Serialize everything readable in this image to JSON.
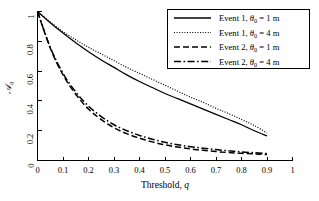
{
  "chart_data": {
    "type": "line",
    "title": "",
    "xlabel": "Threshold, q",
    "ylabel": "A_q",
    "ylabel_symbol": "A",
    "ylabel_subscript": "q",
    "xlim": [
      0,
      1
    ],
    "ylim": [
      0,
      1
    ],
    "grid": false,
    "legend_position": "top-right",
    "xticks": [
      "0",
      "0.1",
      "0.2",
      "0.3",
      "0.4",
      "0.5",
      "0.6",
      "0.7",
      "0.8",
      "0.9",
      "1"
    ],
    "xtick_values": [
      0,
      0.1,
      0.2,
      0.3,
      0.4,
      0.5,
      0.6,
      0.7,
      0.8,
      0.9,
      1
    ],
    "yticks": [
      "0",
      "0.2",
      "0.4",
      "0.6",
      "0.8",
      "1"
    ],
    "ytick_values": [
      0,
      0.2,
      0.4,
      0.6,
      0.8,
      1
    ],
    "x": [
      0,
      0.05,
      0.1,
      0.15,
      0.2,
      0.25,
      0.3,
      0.35,
      0.4,
      0.45,
      0.5,
      0.55,
      0.6,
      0.65,
      0.7,
      0.75,
      0.8,
      0.85,
      0.9
    ],
    "series": [
      {
        "name": "Event 1, θ₀ = 1 m",
        "event": "Event 1",
        "theta_0": "1 m",
        "style": "solid",
        "values": [
          1.0,
          0.925,
          0.855,
          0.79,
          0.73,
          0.675,
          0.625,
          0.575,
          0.53,
          0.49,
          0.45,
          0.415,
          0.38,
          0.345,
          0.31,
          0.275,
          0.24,
          0.2,
          0.165
        ]
      },
      {
        "name": "Event 1, θ₀ = 4 m",
        "event": "Event 1",
        "theta_0": "4 m",
        "style": "dotted",
        "values": [
          1.0,
          0.93,
          0.865,
          0.81,
          0.76,
          0.715,
          0.67,
          0.625,
          0.585,
          0.545,
          0.505,
          0.465,
          0.425,
          0.39,
          0.35,
          0.315,
          0.275,
          0.235,
          0.185
        ]
      },
      {
        "name": "Event 2, θ₀ = 1 m",
        "event": "Event 2",
        "theta_0": "1 m",
        "style": "dashed",
        "values": [
          1.0,
          0.755,
          0.575,
          0.445,
          0.345,
          0.275,
          0.22,
          0.18,
          0.15,
          0.125,
          0.105,
          0.09,
          0.078,
          0.068,
          0.06,
          0.053,
          0.048,
          0.044,
          0.04
        ]
      },
      {
        "name": "Event 2, θ₀ = 4 m",
        "event": "Event 2",
        "theta_0": "4 m",
        "style": "dashdot",
        "values": [
          1.0,
          0.76,
          0.585,
          0.46,
          0.365,
          0.295,
          0.24,
          0.2,
          0.168,
          0.143,
          0.122,
          0.106,
          0.093,
          0.082,
          0.073,
          0.065,
          0.058,
          0.052,
          0.047
        ]
      }
    ]
  },
  "legend": {
    "items": [
      {
        "style": "solid",
        "prefix": "Event 1, ",
        "symbol": "θ",
        "subscript": "0",
        "suffix": " = 1 m"
      },
      {
        "style": "dotted",
        "prefix": "Event 1, ",
        "symbol": "θ",
        "subscript": "0",
        "suffix": " = 4 m"
      },
      {
        "style": "dashed",
        "prefix": "Event 2, ",
        "symbol": "θ",
        "subscript": "0",
        "suffix": " = 1 m"
      },
      {
        "style": "dashdot",
        "prefix": "Event 2, ",
        "symbol": "θ",
        "subscript": "0",
        "suffix": " = 4 m"
      }
    ]
  },
  "colors": {
    "line": "#000000",
    "background": "#ffffff",
    "axis": "#000000"
  }
}
